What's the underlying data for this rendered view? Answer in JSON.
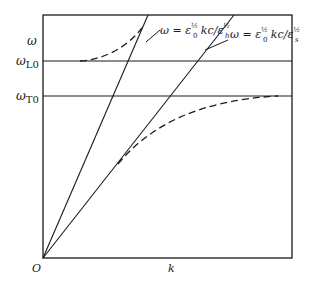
{
  "figure": {
    "type": "dispersion-diagram",
    "axes": {
      "y_label": "ω",
      "x_label": "k",
      "origin_label": "O"
    },
    "levels": [
      {
        "symbol": "ω",
        "subscript": "L0",
        "name": "omega_L0"
      },
      {
        "symbol": "ω",
        "subscript": "T0",
        "name": "omega_T0"
      }
    ],
    "asymptotes": [
      {
        "name": "high-frequency light line",
        "formula_main": "ω = ε",
        "sup1": "½",
        "sub1": "0",
        "middle": " kc/ε",
        "sup2": "½",
        "sub2": "h"
      },
      {
        "name": "low-frequency light line",
        "formula_main": "ω = ε",
        "sup1": "½",
        "sub1": "0",
        "middle": " kc/ε",
        "sup2": "½",
        "sub2": "s"
      }
    ],
    "curves": [
      {
        "name": "upper polariton branch",
        "style": "dashed"
      },
      {
        "name": "lower polariton branch",
        "style": "dashed"
      }
    ],
    "colors": {
      "line": "#1a1a1a",
      "background": "#ffffff"
    }
  }
}
